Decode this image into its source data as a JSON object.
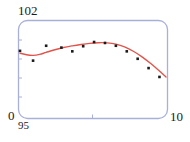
{
  "chart_data": {
    "type": "scatter",
    "title": "",
    "subtitle": "",
    "xlabel": "",
    "ylabel": "",
    "xlim": [
      95,
      10
    ],
    "ylim": [
      0,
      102
    ],
    "grid": false,
    "legend": null,
    "axis_corner_labels": {
      "y_max": "102",
      "y_min": "0",
      "x_min": "95",
      "x_max": "10"
    },
    "x_tick_labels": [
      "95",
      "10"
    ],
    "y_tick_labels": [
      "0",
      "102"
    ],
    "series": [
      {
        "name": "observations",
        "type": "scatter",
        "marker": "square",
        "marker_color": "#1a1a1a",
        "marker_size": 2.6,
        "points": [
          {
            "x": 95.0,
            "y": 71.0
          },
          {
            "x": 95.6,
            "y": 60.5
          },
          {
            "x": 96.2,
            "y": 76.5
          },
          {
            "x": 96.9,
            "y": 74.5
          },
          {
            "x": 97.4,
            "y": 70.5
          },
          {
            "x": 97.9,
            "y": 76.0
          },
          {
            "x": 98.4,
            "y": 80.5
          },
          {
            "x": 98.9,
            "y": 79.5
          },
          {
            "x": 99.4,
            "y": 76.5
          },
          {
            "x": 99.9,
            "y": 70.5
          },
          {
            "x": 100.4,
            "y": 62.5
          },
          {
            "x": 100.9,
            "y": 52.5
          },
          {
            "x": 101.4,
            "y": 43.0
          }
        ]
      },
      {
        "name": "fitted-curve",
        "type": "line",
        "line_color": "#e2544b",
        "line_width": 1.4,
        "points": [
          {
            "x": 95.0,
            "y": 68.5
          },
          {
            "x": 95.3,
            "y": 66.8
          },
          {
            "x": 95.6,
            "y": 66.2
          },
          {
            "x": 95.9,
            "y": 67.2
          },
          {
            "x": 96.2,
            "y": 69.4
          },
          {
            "x": 96.6,
            "y": 72.2
          },
          {
            "x": 97.0,
            "y": 74.6
          },
          {
            "x": 97.4,
            "y": 76.4
          },
          {
            "x": 97.8,
            "y": 77.9
          },
          {
            "x": 98.2,
            "y": 79.1
          },
          {
            "x": 98.6,
            "y": 79.8
          },
          {
            "x": 99.0,
            "y": 79.6
          },
          {
            "x": 99.4,
            "y": 78.2
          },
          {
            "x": 99.8,
            "y": 75.2
          },
          {
            "x": 100.2,
            "y": 70.6
          },
          {
            "x": 100.6,
            "y": 64.6
          },
          {
            "x": 101.0,
            "y": 57.4
          },
          {
            "x": 101.4,
            "y": 49.4
          },
          {
            "x": 101.7,
            "y": 43.0
          }
        ]
      }
    ],
    "colors": {
      "frame": "#a8b0d8",
      "curve": "#e2544b",
      "markers": "#1a1a1a",
      "background": "#ffffff",
      "tick": "#a8b0d8"
    }
  }
}
